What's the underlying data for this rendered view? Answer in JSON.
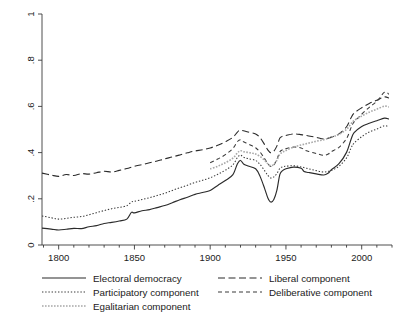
{
  "chart_data": {
    "type": "line",
    "title": "",
    "subtitle": "",
    "xlabel": "",
    "ylabel": "",
    "xlim": [
      1789,
      2020
    ],
    "ylim": [
      0,
      1
    ],
    "grid": false,
    "legend_position": "bottom",
    "y_ticks": [
      0,
      0.2,
      0.4,
      0.6,
      0.8,
      1
    ],
    "y_tick_labels": [
      "0",
      ".2",
      ".4",
      ".6",
      ".8",
      "1"
    ],
    "x_ticks": [
      1800,
      1850,
      1900,
      1950,
      2000
    ],
    "x_tick_labels": [
      "1800",
      "1850",
      "1900",
      "1950",
      "2000"
    ],
    "x_minor_step": 10,
    "series": [
      {
        "name": "Electoral democracy",
        "style": "solid",
        "color": "#2b2b2b",
        "width": 1.15,
        "x": [
          1789,
          1795,
          1800,
          1805,
          1810,
          1815,
          1820,
          1825,
          1830,
          1835,
          1840,
          1845,
          1848,
          1850,
          1855,
          1860,
          1865,
          1870,
          1875,
          1880,
          1885,
          1890,
          1895,
          1900,
          1905,
          1910,
          1915,
          1918,
          1920,
          1922,
          1925,
          1930,
          1933,
          1936,
          1938,
          1940,
          1942,
          1944,
          1946,
          1948,
          1950,
          1955,
          1960,
          1962,
          1965,
          1970,
          1975,
          1978,
          1980,
          1985,
          1990,
          1993,
          1995,
          2000,
          2005,
          2010,
          2015,
          2018
        ],
        "y": [
          0.073,
          0.069,
          0.065,
          0.068,
          0.072,
          0.071,
          0.079,
          0.084,
          0.093,
          0.098,
          0.104,
          0.112,
          0.141,
          0.139,
          0.148,
          0.153,
          0.162,
          0.171,
          0.183,
          0.196,
          0.207,
          0.219,
          0.227,
          0.236,
          0.258,
          0.279,
          0.305,
          0.352,
          0.366,
          0.351,
          0.342,
          0.33,
          0.296,
          0.243,
          0.205,
          0.186,
          0.197,
          0.236,
          0.306,
          0.323,
          0.33,
          0.337,
          0.332,
          0.318,
          0.314,
          0.308,
          0.303,
          0.312,
          0.326,
          0.352,
          0.401,
          0.458,
          0.486,
          0.513,
          0.527,
          0.538,
          0.549,
          0.545
        ]
      },
      {
        "name": "Liberal component",
        "style": "longdash",
        "color": "#2b2b2b",
        "width": 1.1,
        "x": [
          1789,
          1795,
          1800,
          1805,
          1810,
          1815,
          1820,
          1825,
          1830,
          1835,
          1840,
          1845,
          1850,
          1855,
          1860,
          1865,
          1870,
          1875,
          1880,
          1885,
          1890,
          1895,
          1900,
          1905,
          1910,
          1915,
          1918,
          1920,
          1925,
          1930,
          1933,
          1936,
          1938,
          1940,
          1942,
          1944,
          1946,
          1948,
          1950,
          1955,
          1960,
          1965,
          1970,
          1975,
          1980,
          1985,
          1990,
          1993,
          1995,
          2000,
          2005,
          2010,
          2015,
          2018
        ],
        "y": [
          0.311,
          0.303,
          0.297,
          0.305,
          0.301,
          0.309,
          0.307,
          0.313,
          0.319,
          0.316,
          0.323,
          0.331,
          0.341,
          0.348,
          0.356,
          0.364,
          0.373,
          0.381,
          0.39,
          0.399,
          0.407,
          0.412,
          0.42,
          0.432,
          0.447,
          0.466,
          0.489,
          0.497,
          0.489,
          0.481,
          0.464,
          0.434,
          0.412,
          0.399,
          0.406,
          0.428,
          0.463,
          0.471,
          0.474,
          0.481,
          0.478,
          0.472,
          0.466,
          0.459,
          0.467,
          0.481,
          0.512,
          0.551,
          0.571,
          0.594,
          0.613,
          0.627,
          0.641,
          0.636
        ]
      },
      {
        "name": "Participatory component",
        "style": "dotted",
        "color": "#3a3a3a",
        "width": 1.05,
        "x": [
          1789,
          1795,
          1800,
          1805,
          1810,
          1815,
          1820,
          1825,
          1830,
          1835,
          1840,
          1845,
          1848,
          1850,
          1855,
          1860,
          1865,
          1870,
          1875,
          1880,
          1885,
          1890,
          1895,
          1900,
          1905,
          1910,
          1915,
          1918,
          1920,
          1922,
          1925,
          1930,
          1933,
          1936,
          1938,
          1940,
          1942,
          1944,
          1946,
          1948,
          1950,
          1955,
          1960,
          1965,
          1970,
          1975,
          1980,
          1985,
          1990,
          1993,
          1995,
          2000,
          2005,
          2010,
          2015,
          2018
        ],
        "y": [
          0.126,
          0.118,
          0.112,
          0.115,
          0.12,
          0.123,
          0.131,
          0.14,
          0.149,
          0.157,
          0.163,
          0.17,
          0.186,
          0.189,
          0.197,
          0.205,
          0.214,
          0.224,
          0.236,
          0.248,
          0.259,
          0.271,
          0.28,
          0.291,
          0.306,
          0.324,
          0.347,
          0.379,
          0.389,
          0.38,
          0.374,
          0.366,
          0.348,
          0.321,
          0.302,
          0.29,
          0.295,
          0.309,
          0.332,
          0.339,
          0.341,
          0.343,
          0.338,
          0.33,
          0.322,
          0.316,
          0.323,
          0.341,
          0.377,
          0.42,
          0.441,
          0.469,
          0.489,
          0.502,
          0.516,
          0.511
        ]
      },
      {
        "name": "Deliberative component",
        "style": "dash",
        "color": "#3a3a3a",
        "width": 1.05,
        "x": [
          1900,
          1905,
          1910,
          1915,
          1918,
          1920,
          1922,
          1925,
          1928,
          1930,
          1933,
          1936,
          1938,
          1940,
          1942,
          1944,
          1946,
          1948,
          1950,
          1955,
          1960,
          1963,
          1965,
          1970,
          1975,
          1978,
          1980,
          1985,
          1990,
          1993,
          1995,
          2000,
          2005,
          2010,
          2015,
          2018
        ],
        "y": [
          0.356,
          0.372,
          0.391,
          0.418,
          0.448,
          0.456,
          0.447,
          0.438,
          0.428,
          0.421,
          0.402,
          0.373,
          0.352,
          0.34,
          0.347,
          0.37,
          0.404,
          0.413,
          0.417,
          0.424,
          0.42,
          0.409,
          0.405,
          0.396,
          0.388,
          0.394,
          0.404,
          0.423,
          0.461,
          0.508,
          0.533,
          0.566,
          0.596,
          0.622,
          0.661,
          0.653
        ]
      },
      {
        "name": "Egalitarian component",
        "style": "dotted-light",
        "color": "#a8a8a8",
        "width": 1.6,
        "x": [
          1900,
          1905,
          1910,
          1915,
          1918,
          1920,
          1922,
          1925,
          1928,
          1930,
          1933,
          1936,
          1938,
          1940,
          1942,
          1944,
          1946,
          1948,
          1950,
          1955,
          1960,
          1965,
          1970,
          1975,
          1980,
          1985,
          1990,
          1993,
          1995,
          2000,
          2005,
          2010,
          2015,
          2018
        ],
        "y": [
          0.329,
          0.341,
          0.356,
          0.376,
          0.399,
          0.408,
          0.404,
          0.401,
          0.397,
          0.394,
          0.383,
          0.366,
          0.352,
          0.343,
          0.349,
          0.366,
          0.393,
          0.402,
          0.409,
          0.424,
          0.433,
          0.441,
          0.449,
          0.456,
          0.466,
          0.479,
          0.501,
          0.525,
          0.539,
          0.558,
          0.575,
          0.588,
          0.601,
          0.598
        ]
      }
    ]
  },
  "legend": {
    "entries": [
      {
        "label": "Electoral democracy",
        "style": "solid",
        "color": "#2b2b2b"
      },
      {
        "label": "Liberal component",
        "style": "longdash",
        "color": "#2b2b2b"
      },
      {
        "label": "Participatory component",
        "style": "dotted",
        "color": "#3a3a3a"
      },
      {
        "label": "Deliberative component",
        "style": "dash",
        "color": "#3a3a3a"
      },
      {
        "label": "Egalitarian component",
        "style": "dotted-light",
        "color": "#a8a8a8"
      }
    ]
  }
}
